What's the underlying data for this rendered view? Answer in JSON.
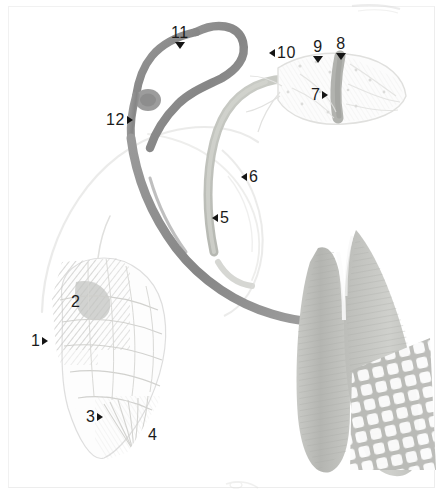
{
  "figure": {
    "background_color": "#ffffff",
    "border_color": "#f1f1f1",
    "label_color": "#1b1b1b",
    "width": 443,
    "height": 499
  },
  "palette": {
    "stem_dark": "#8f8f8f",
    "stem_mid": "#a9a9a9",
    "stem_light": "#c3c5c0",
    "leaf_dark": "#b9bab6",
    "leaf_mid": "#cfd0cc",
    "outline_faint": "#e2e2e0",
    "hatch": "#c9c9c6",
    "mesh": "#c6c7c3"
  },
  "labels": [
    {
      "id": "label-11",
      "text": "11",
      "marker": "down",
      "x": 171,
      "y": 25
    },
    {
      "id": "label-10",
      "text": "10",
      "marker": "left",
      "x": 269,
      "y": 45
    },
    {
      "id": "label-9",
      "text": "9",
      "marker": "down",
      "x": 313,
      "y": 39
    },
    {
      "id": "label-8",
      "text": "8",
      "marker": "down",
      "x": 336,
      "y": 36
    },
    {
      "id": "label-7",
      "text": "7",
      "marker": "right",
      "x": 311,
      "y": 87
    },
    {
      "id": "label-12",
      "text": "12",
      "marker": "right",
      "x": 106,
      "y": 112
    },
    {
      "id": "label-6",
      "text": "6",
      "marker": "left",
      "x": 241,
      "y": 169
    },
    {
      "id": "label-5",
      "text": "5",
      "marker": "left",
      "x": 212,
      "y": 210
    },
    {
      "id": "label-2",
      "text": "2",
      "marker": "none",
      "x": 71,
      "y": 294
    },
    {
      "id": "label-1",
      "text": "1",
      "marker": "right",
      "x": 31,
      "y": 333
    },
    {
      "id": "label-3",
      "text": "3",
      "marker": "right",
      "x": 86,
      "y": 409
    },
    {
      "id": "label-4",
      "text": "4",
      "marker": "none",
      "x": 148,
      "y": 427
    }
  ],
  "artwork_parts": [
    {
      "name": "upper-stem-dark",
      "description": "dark curved stem rising to top and hooking right"
    },
    {
      "name": "stem-node-knot",
      "description": "swollen node knot on dark stem"
    },
    {
      "name": "lower-stem-dark",
      "description": "dark stem descending to lower right"
    },
    {
      "name": "secondary-stem-light",
      "description": "pale green-gray stem arcing to upper right"
    },
    {
      "name": "bract-upper-right",
      "description": "pointed bract with dark midvein at upper right"
    },
    {
      "name": "bud-lower-left",
      "description": "hatched flower bud at lower left"
    },
    {
      "name": "leaf-blade-right",
      "description": "large dark textured leaf blades at right"
    },
    {
      "name": "mesh-panel",
      "description": "net / mesh texture panel at lower right"
    },
    {
      "name": "pale-outline-arc",
      "description": "faint outline arc across mid-left"
    }
  ]
}
